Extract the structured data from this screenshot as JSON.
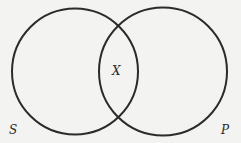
{
  "diagram": {
    "type": "venn",
    "circles": [
      {
        "id": "S",
        "label": "S",
        "cx": 75,
        "cy": 71.5,
        "r": 63
      },
      {
        "id": "P",
        "label": "P",
        "cx": 163,
        "cy": 71.5,
        "r": 64
      }
    ],
    "intersection_mark": "X",
    "colors": {
      "stroke": "#2b2b2b",
      "background": "#f3f3f1",
      "text": "#2a2a2a"
    }
  }
}
